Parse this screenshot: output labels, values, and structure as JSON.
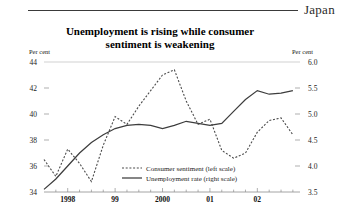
{
  "header": {
    "region_label": "Japan"
  },
  "title": {
    "line1": "Unemployment is rising while consumer",
    "line2": "sentiment is weakening"
  },
  "axis_units": {
    "left": "Per cent",
    "right": "Per cent"
  },
  "chart_data": {
    "type": "line",
    "title": "Unemployment is rising while consumer sentiment is weakening",
    "xlabel": "",
    "ylabel": "Per cent",
    "grid": true,
    "legend_position": "center",
    "x_tick_labels": [
      "1998",
      "99",
      "2000",
      "01",
      "02"
    ],
    "x_tick_label_positions": [
      1998.0,
      1999.0,
      2000.0,
      2001.0,
      2002.0
    ],
    "xlim": [
      1997.5,
      2002.9
    ],
    "minor_tick_step": 0.25,
    "left_axis": {
      "label": "Per cent",
      "ylim": [
        34,
        44
      ],
      "ticks": [
        34,
        36,
        38,
        40,
        42,
        44
      ]
    },
    "right_axis": {
      "label": "Per cent",
      "ylim": [
        3.5,
        6.0
      ],
      "ticks": [
        3.5,
        4.0,
        4.5,
        5.0,
        5.5,
        6.0
      ]
    },
    "series": [
      {
        "name": "Consumer sentiment (left scale)",
        "axis": "left",
        "style": "dashed",
        "color": "#4a4a4a",
        "x": [
          1997.5,
          1997.75,
          1998.0,
          1998.25,
          1998.5,
          1998.75,
          1999.0,
          1999.25,
          1999.5,
          1999.75,
          2000.0,
          2000.25,
          2000.5,
          2000.75,
          2001.0,
          2001.25,
          2001.5,
          2001.75,
          2002.0,
          2002.25,
          2002.5,
          2002.75
        ],
        "values": [
          36.5,
          35.2,
          37.3,
          36.2,
          34.8,
          37.6,
          39.8,
          39.2,
          40.6,
          41.8,
          43.0,
          43.4,
          41.0,
          39.2,
          39.6,
          37.2,
          36.6,
          37.0,
          38.6,
          39.5,
          39.7,
          38.4
        ]
      },
      {
        "name": "Unemployment rate (right scale)",
        "axis": "right",
        "style": "solid",
        "color": "#3d3d3d",
        "x": [
          1997.5,
          1997.75,
          1998.0,
          1998.25,
          1998.5,
          1998.75,
          1999.0,
          1999.25,
          1999.5,
          1999.75,
          2000.0,
          2000.25,
          2000.5,
          2000.75,
          2001.0,
          2001.25,
          2001.5,
          2001.75,
          2002.0,
          2002.25,
          2002.5,
          2002.75
        ],
        "values": [
          3.55,
          3.75,
          4.0,
          4.25,
          4.45,
          4.6,
          4.72,
          4.78,
          4.8,
          4.78,
          4.72,
          4.78,
          4.86,
          4.82,
          4.78,
          4.82,
          5.05,
          5.28,
          5.45,
          5.38,
          5.4,
          5.45
        ]
      }
    ],
    "legend": [
      {
        "label": "Consumer sentiment (left scale)",
        "style": "dashed"
      },
      {
        "label": "Unemployment rate (right scale)",
        "style": "solid"
      }
    ]
  }
}
